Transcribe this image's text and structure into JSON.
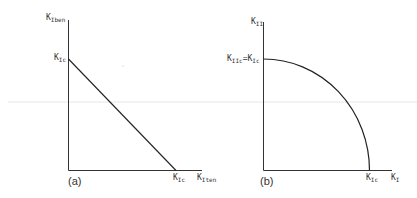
{
  "diagram": {
    "colors": {
      "axis": "#333333",
      "curve": "#222222",
      "background": "#ffffff",
      "scanline": "#e6e6e6"
    },
    "panel_a": {
      "caption": "(a)",
      "y_axis_label": {
        "base": "K",
        "sub": "Iben"
      },
      "x_axis_label": {
        "base": "K",
        "sub": "Iten"
      },
      "y_intercept_label": {
        "base": "K",
        "sub": "Ic"
      },
      "x_intercept_label": {
        "base": "K",
        "sub": "Ic"
      },
      "curve": "linear"
    },
    "panel_b": {
      "caption": "(b)",
      "y_axis_label": {
        "base": "K",
        "sub": "II"
      },
      "x_axis_label": {
        "base": "K",
        "sub": "I"
      },
      "y_intercept_label": {
        "base": "K",
        "sub": "IIc",
        "eq": "=",
        "base2": "K",
        "sub2": "Ic"
      },
      "x_intercept_label": {
        "base": "K",
        "sub": "Ic"
      },
      "curve": "quarter-ellipse"
    }
  }
}
